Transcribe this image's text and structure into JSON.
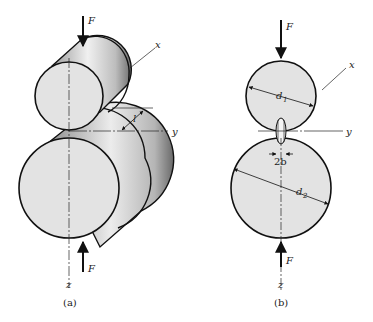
{
  "figure": {
    "panel_a": {
      "caption": "(a)",
      "force_top": "F",
      "force_bottom": "F",
      "axis_x": "x",
      "axis_y": "y",
      "axis_z": "z",
      "length_label": "l"
    },
    "panel_b": {
      "caption": "(b)",
      "force_top": "F",
      "force_bottom": "F",
      "axis_x": "x",
      "axis_y": "y",
      "axis_z": "z",
      "diameter_top": "d",
      "diameter_top_sub": "1",
      "diameter_bottom": "d",
      "diameter_bottom_sub": "2",
      "contact_width": "2b"
    },
    "colors": {
      "face_fill": "#e3e3e3",
      "outline": "#111111",
      "shade_dark": "#8a8a8a",
      "shade_light": "#f2f2f2"
    }
  }
}
